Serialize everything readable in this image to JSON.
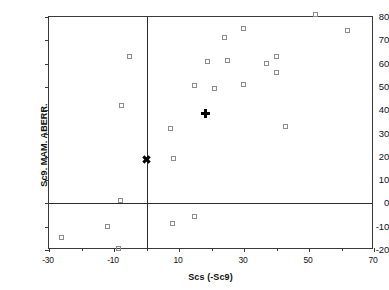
{
  "chart_data": {
    "type": "scatter",
    "title": "",
    "xlabel": "Scs (-Sc9)",
    "ylabel": "Sc9. MAM. ABERR.",
    "xlim": [
      -30,
      70
    ],
    "ylim": [
      -20,
      80
    ],
    "grid": false,
    "legend": "none",
    "xticks": [
      -30,
      -10,
      10,
      30,
      50,
      70
    ],
    "xticks_minor": [
      -20,
      0,
      20,
      40,
      60
    ],
    "yticks": [
      80,
      70,
      60,
      50,
      40,
      30,
      20,
      10,
      0,
      -10,
      -20
    ],
    "xtick_labels": [
      "-30",
      "-10",
      "10",
      "30",
      "50",
      "70"
    ],
    "ytick_labels": [
      "80",
      "70",
      "60",
      "50",
      "40",
      "30",
      "20",
      "10",
      "0",
      "-10",
      "-20"
    ],
    "reference_lines": [
      {
        "axis": "x",
        "value": 0
      },
      {
        "axis": "y",
        "value": 0
      }
    ],
    "series": [
      {
        "name": "samples",
        "marker": "open-square",
        "color": "#8c8c8c",
        "points": [
          {
            "x": -26,
            "y": -15
          },
          {
            "x": -12,
            "y": -10
          },
          {
            "x": -8.5,
            "y": -19.5
          },
          {
            "x": -8,
            "y": 1
          },
          {
            "x": -7.5,
            "y": 42
          },
          {
            "x": -5,
            "y": 63
          },
          {
            "x": 7.5,
            "y": 32
          },
          {
            "x": 8,
            "y": -9
          },
          {
            "x": 8.5,
            "y": 19
          },
          {
            "x": 15,
            "y": -6
          },
          {
            "x": 15,
            "y": 50.5
          },
          {
            "x": 19,
            "y": 60.5
          },
          {
            "x": 21,
            "y": 49
          },
          {
            "x": 24,
            "y": 71
          },
          {
            "x": 25,
            "y": 61
          },
          {
            "x": 30,
            "y": 75
          },
          {
            "x": 30,
            "y": 51
          },
          {
            "x": 37,
            "y": 60
          },
          {
            "x": 40,
            "y": 63
          },
          {
            "x": 40,
            "y": 56
          },
          {
            "x": 43,
            "y": 33
          },
          {
            "x": 52,
            "y": 81
          },
          {
            "x": 62,
            "y": 74
          }
        ]
      },
      {
        "name": "mean-marker",
        "marker": "plus",
        "color": "#000000",
        "points": [
          {
            "x": 18,
            "y": 38.5
          }
        ]
      },
      {
        "name": "origin-marker",
        "marker": "x",
        "color": "#000000",
        "points": [
          {
            "x": 0,
            "y": 19
          }
        ]
      }
    ]
  }
}
